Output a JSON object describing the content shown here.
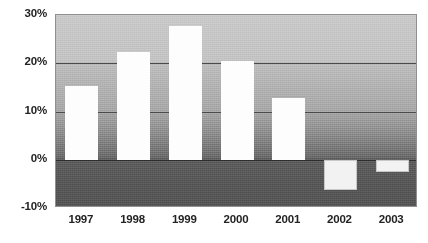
{
  "chart_data": {
    "type": "bar",
    "title": "",
    "subtitle": "",
    "xlabel": "",
    "ylabel": "",
    "categories": [
      "1997",
      "1998",
      "1999",
      "2000",
      "2001",
      "2002",
      "2003"
    ],
    "values": [
      15.3,
      22.4,
      27.7,
      20.5,
      12.9,
      -6.3,
      -2.5
    ],
    "series": [
      {
        "name": "",
        "values": [
          15.3,
          22.4,
          27.7,
          20.5,
          12.9,
          -6.3,
          -2.5
        ]
      }
    ],
    "ylim": [
      -10,
      30
    ],
    "ytick_labels": [
      "30%",
      "20%",
      "10%",
      "0%",
      "-10%"
    ],
    "ytick_values": [
      30,
      20,
      10,
      0,
      -10
    ],
    "grid": true,
    "legend": false,
    "legend_position": "none",
    "bar_color": "#fdfdfd",
    "plot_background_top_color": "#c9c9c9",
    "plot_background_bottom_color": "#565656",
    "axis_text_color": "#232323",
    "gridline_color": "#4a4a4a"
  }
}
